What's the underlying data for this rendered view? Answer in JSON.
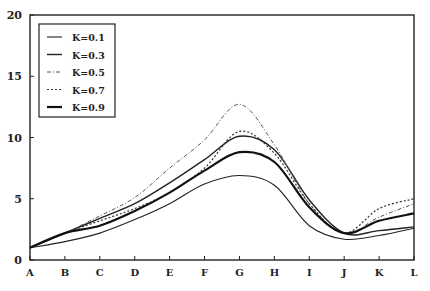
{
  "chart_data": {
    "type": "line",
    "title": "",
    "xlabel": "",
    "ylabel": "",
    "categories": [
      "A",
      "B",
      "C",
      "D",
      "E",
      "F",
      "G",
      "H",
      "I",
      "J",
      "K",
      "L"
    ],
    "ylim": [
      0,
      20
    ],
    "yticks": [
      0,
      5,
      10,
      15,
      20
    ],
    "grid": false,
    "legend_position": "upper left",
    "series": [
      {
        "name": "K=0.1",
        "style": "solid-thin",
        "values": [
          1.0,
          1.5,
          2.2,
          3.3,
          4.6,
          6.2,
          6.9,
          6.1,
          2.8,
          1.7,
          2.0,
          2.6
        ]
      },
      {
        "name": "K=0.3",
        "style": "solid",
        "values": [
          1.0,
          2.2,
          3.4,
          4.6,
          6.3,
          8.2,
          10.1,
          9.0,
          4.9,
          2.2,
          2.4,
          2.7
        ]
      },
      {
        "name": "K=0.5",
        "style": "dash-dot",
        "values": [
          1.0,
          2.2,
          3.6,
          5.1,
          7.5,
          9.8,
          12.7,
          9.4,
          4.6,
          2.2,
          3.5,
          4.6
        ]
      },
      {
        "name": "K=0.7",
        "style": "dotted",
        "values": [
          1.0,
          2.2,
          3.2,
          4.2,
          5.5,
          7.5,
          10.5,
          8.7,
          4.6,
          2.2,
          4.2,
          5.0
        ]
      },
      {
        "name": "K=0.9",
        "style": "solid-thick",
        "values": [
          1.0,
          2.2,
          2.8,
          4.0,
          5.5,
          7.3,
          8.8,
          8.0,
          4.3,
          2.2,
          3.2,
          3.8
        ]
      }
    ]
  },
  "legend": {
    "items": [
      {
        "label": "K=0.1"
      },
      {
        "label": "K=0.3"
      },
      {
        "label": "K=0.5"
      },
      {
        "label": "K=0.7"
      },
      {
        "label": "K=0.9"
      }
    ]
  },
  "axes": {
    "y_tick_labels": [
      "0",
      "5",
      "10",
      "15",
      "20"
    ],
    "x_tick_labels": [
      "A",
      "B",
      "C",
      "D",
      "E",
      "F",
      "G",
      "H",
      "I",
      "J",
      "K",
      "L"
    ]
  }
}
